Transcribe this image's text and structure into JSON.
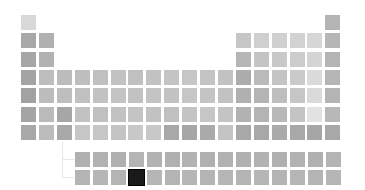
{
  "table": {
    "selected_element": "U",
    "colors": {
      "background": "#ffffff",
      "selected": "#1a1a1a"
    },
    "main_rows": [
      [
        {
          "s": "H",
          "g": "#d8d8d8",
          "c": 1
        },
        {
          "s": "He",
          "g": "#b4b4b4",
          "c": 18
        }
      ],
      [
        {
          "s": "Li",
          "g": "#a8a8a8",
          "c": 1
        },
        {
          "s": "Be",
          "g": "#b0b0b0",
          "c": 2
        },
        {
          "s": "B",
          "g": "#c6c6c6",
          "c": 13
        },
        {
          "s": "C",
          "g": "#cfcfcf",
          "c": 14
        },
        {
          "s": "N",
          "g": "#d0d0d0",
          "c": 15
        },
        {
          "s": "O",
          "g": "#d2d2d2",
          "c": 16
        },
        {
          "s": "F",
          "g": "#d6d6d6",
          "c": 17
        },
        {
          "s": "Ne",
          "g": "#b6b6b6",
          "c": 18
        }
      ],
      [
        {
          "s": "Na",
          "g": "#a6a6a6",
          "c": 1
        },
        {
          "s": "Mg",
          "g": "#b2b2b2",
          "c": 2
        },
        {
          "s": "Al",
          "g": "#b6b6b6",
          "c": 13
        },
        {
          "s": "Si",
          "g": "#c4c4c4",
          "c": 14
        },
        {
          "s": "P",
          "g": "#c8c8c8",
          "c": 15
        },
        {
          "s": "S",
          "g": "#cccccc",
          "c": 16
        },
        {
          "s": "Cl",
          "g": "#d4d4d4",
          "c": 17
        },
        {
          "s": "Ar",
          "g": "#b4b4b4",
          "c": 18
        }
      ],
      [
        {
          "s": "K",
          "g": "#a4a4a4",
          "c": 1
        },
        {
          "s": "Ca",
          "g": "#bdbdbd",
          "c": 2
        },
        {
          "s": "Sc",
          "g": "#bcbcbc",
          "c": 3
        },
        {
          "s": "Ti",
          "g": "#bebebe",
          "c": 4
        },
        {
          "s": "V",
          "g": "#c0c0c0",
          "c": 5
        },
        {
          "s": "Cr",
          "g": "#c2c2c2",
          "c": 6
        },
        {
          "s": "Mn",
          "g": "#c0c0c0",
          "c": 7
        },
        {
          "s": "Fe",
          "g": "#c2c2c2",
          "c": 8
        },
        {
          "s": "Co",
          "g": "#c4c4c4",
          "c": 9
        },
        {
          "s": "Ni",
          "g": "#c6c6c6",
          "c": 10
        },
        {
          "s": "Cu",
          "g": "#c4c4c4",
          "c": 11
        },
        {
          "s": "Zn",
          "g": "#c2c2c2",
          "c": 12
        },
        {
          "s": "Ga",
          "g": "#acacac",
          "c": 13
        },
        {
          "s": "Ge",
          "g": "#bababa",
          "c": 14
        },
        {
          "s": "As",
          "g": "#c4c4c4",
          "c": 15
        },
        {
          "s": "Se",
          "g": "#cacaca",
          "c": 16
        },
        {
          "s": "Br",
          "g": "#dadada",
          "c": 17
        },
        {
          "s": "Kr",
          "g": "#b6b6b6",
          "c": 18
        }
      ],
      [
        {
          "s": "Rb",
          "g": "#a2a2a2",
          "c": 1
        },
        {
          "s": "Sr",
          "g": "#bcbcbc",
          "c": 2
        },
        {
          "s": "Y",
          "g": "#bebebe",
          "c": 3
        },
        {
          "s": "Zr",
          "g": "#c0c0c0",
          "c": 4
        },
        {
          "s": "Nb",
          "g": "#c2c2c2",
          "c": 5
        },
        {
          "s": "Mo",
          "g": "#c4c4c4",
          "c": 6
        },
        {
          "s": "Tc",
          "g": "#c2c2c2",
          "c": 7
        },
        {
          "s": "Ru",
          "g": "#c4c4c4",
          "c": 8
        },
        {
          "s": "Rh",
          "g": "#c2c2c2",
          "c": 9
        },
        {
          "s": "Pd",
          "g": "#c6c6c6",
          "c": 10
        },
        {
          "s": "Ag",
          "g": "#c4c4c4",
          "c": 11
        },
        {
          "s": "Cd",
          "g": "#c2c2c2",
          "c": 12
        },
        {
          "s": "In",
          "g": "#b0b0b0",
          "c": 13
        },
        {
          "s": "Sn",
          "g": "#b4b4b4",
          "c": 14
        },
        {
          "s": "Sb",
          "g": "#bebebe",
          "c": 15
        },
        {
          "s": "Te",
          "g": "#c6c6c6",
          "c": 16
        },
        {
          "s": "I",
          "g": "#dadada",
          "c": 17
        },
        {
          "s": "Xe",
          "g": "#b4b4b4",
          "c": 18
        }
      ],
      [
        {
          "s": "Cs",
          "g": "#a4a4a4",
          "c": 1
        },
        {
          "s": "Ba",
          "g": "#bababa",
          "c": 2
        },
        {
          "s": "La",
          "g": "#a6a6a6",
          "c": 3
        },
        {
          "s": "Hf",
          "g": "#c2c2c2",
          "c": 4
        },
        {
          "s": "Ta",
          "g": "#c0c0c0",
          "c": 5
        },
        {
          "s": "W",
          "g": "#c2c2c2",
          "c": 6
        },
        {
          "s": "Re",
          "g": "#c4c4c4",
          "c": 7
        },
        {
          "s": "Os",
          "g": "#c2c2c2",
          "c": 8
        },
        {
          "s": "Ir",
          "g": "#c0c0c0",
          "c": 9
        },
        {
          "s": "Pt",
          "g": "#c4c4c4",
          "c": 10
        },
        {
          "s": "Au",
          "g": "#c6c6c6",
          "c": 11
        },
        {
          "s": "Hg",
          "g": "#c4c4c4",
          "c": 12
        },
        {
          "s": "Tl",
          "g": "#b2b2b2",
          "c": 13
        },
        {
          "s": "Pb",
          "g": "#b4b4b4",
          "c": 14
        },
        {
          "s": "Bi",
          "g": "#b8b8b8",
          "c": 15
        },
        {
          "s": "Po",
          "g": "#c4c4c4",
          "c": 16
        },
        {
          "s": "At",
          "g": "#e2e2e2",
          "c": 17
        },
        {
          "s": "Rn",
          "g": "#b8b8b8",
          "c": 18
        }
      ],
      [
        {
          "s": "Fr",
          "g": "#a8a8a8",
          "c": 1
        },
        {
          "s": "Ra",
          "g": "#bcbcbc",
          "c": 2
        },
        {
          "s": "Ac",
          "g": "#a8a8a8",
          "c": 3
        },
        {
          "s": "Rf",
          "g": "#c6c6c6",
          "c": 4
        },
        {
          "s": "Db",
          "g": "#c6c6c6",
          "c": 5
        },
        {
          "s": "Sg",
          "g": "#c4c4c4",
          "c": 6
        },
        {
          "s": "Bh",
          "g": "#c8c8c8",
          "c": 7
        },
        {
          "s": "Hs",
          "g": "#c8c8c8",
          "c": 8
        },
        {
          "s": "Mt",
          "g": "#a8a8a8",
          "c": 9
        },
        {
          "s": "Ds",
          "g": "#a6a6a6",
          "c": 10
        },
        {
          "s": "Rg",
          "g": "#aaaaaa",
          "c": 11
        },
        {
          "s": "Cn",
          "g": "#c4c4c4",
          "c": 12
        },
        {
          "s": "Nh",
          "g": "#a8a8a8",
          "c": 13
        },
        {
          "s": "Fl",
          "g": "#a8a8a8",
          "c": 14
        },
        {
          "s": "Mc",
          "g": "#aaaaaa",
          "c": 15
        },
        {
          "s": "Lv",
          "g": "#a8a8a8",
          "c": 16
        },
        {
          "s": "Ts",
          "g": "#a6a6a6",
          "c": 17
        },
        {
          "s": "Og",
          "g": "#a8a8a8",
          "c": 18
        }
      ]
    ],
    "lanthanides": [
      {
        "s": "Ce",
        "g": "#b0b0b0"
      },
      {
        "s": "Pr",
        "g": "#b2b2b2"
      },
      {
        "s": "Nd",
        "g": "#b0b0b0"
      },
      {
        "s": "Pm",
        "g": "#b4b4b4"
      },
      {
        "s": "Sm",
        "g": "#b2b2b2"
      },
      {
        "s": "Eu",
        "g": "#b0b0b0"
      },
      {
        "s": "Gd",
        "g": "#b2b2b2"
      },
      {
        "s": "Tb",
        "g": "#b0b0b0"
      },
      {
        "s": "Dy",
        "g": "#b2b2b2"
      },
      {
        "s": "Ho",
        "g": "#b0b0b0"
      },
      {
        "s": "Er",
        "g": "#b2b2b2"
      },
      {
        "s": "Tm",
        "g": "#b0b0b0"
      },
      {
        "s": "Yb",
        "g": "#b2b2b2"
      },
      {
        "s": "Lu",
        "g": "#b0b0b0"
      },
      {
        "s": "—",
        "g": "#b4b4b4"
      }
    ],
    "actinides": [
      {
        "s": "Th",
        "g": "#b4b4b4"
      },
      {
        "s": "Pa",
        "g": "#b6b6b6"
      },
      {
        "s": "U-prev",
        "g": "#b4b4b4"
      },
      {
        "s": "U",
        "g": "#1a1a1a"
      },
      {
        "s": "Np",
        "g": "#b6b6b6"
      },
      {
        "s": "Pu",
        "g": "#b4b4b4"
      },
      {
        "s": "Am",
        "g": "#b6b6b6"
      },
      {
        "s": "Cm",
        "g": "#b4b4b4"
      },
      {
        "s": "Bk",
        "g": "#b6b6b6"
      },
      {
        "s": "Cf",
        "g": "#b4b4b4"
      },
      {
        "s": "Es",
        "g": "#b6b6b6"
      },
      {
        "s": "Fm",
        "g": "#b4b4b4"
      },
      {
        "s": "Md",
        "g": "#b6b6b6"
      },
      {
        "s": "No",
        "g": "#b4b4b4"
      },
      {
        "s": "Lr",
        "g": "#b6b6b6"
      }
    ]
  }
}
